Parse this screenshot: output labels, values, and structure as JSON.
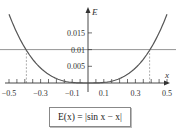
{
  "chart_data": {
    "type": "line",
    "title": "",
    "xlabel": "x",
    "ylabel": "E",
    "xlim": [
      -0.5,
      0.5
    ],
    "ylim": [
      0,
      0.02
    ],
    "x_tick_labels": [
      "-0.5",
      "-0.3",
      "-0.1",
      "0.1",
      "0.3",
      "0.5"
    ],
    "y_tick_labels": [
      "0.005",
      "0.01",
      "0.015"
    ],
    "grid": false,
    "series": [
      {
        "name": "E(x) = |sin x - x|",
        "x": [
          -0.5,
          -0.45,
          -0.4,
          -0.35,
          -0.3,
          -0.25,
          -0.2,
          -0.15,
          -0.1,
          -0.05,
          0,
          0.05,
          0.1,
          0.15,
          0.2,
          0.25,
          0.3,
          0.35,
          0.4,
          0.45,
          0.5
        ],
        "values": [
          0.0206,
          0.0151,
          0.0106,
          0.0071,
          0.0045,
          0.0026,
          0.0013,
          0.0006,
          0.0002,
          2e-05,
          0,
          2e-05,
          0.0002,
          0.0006,
          0.0013,
          0.0026,
          0.0045,
          0.0071,
          0.0106,
          0.0151,
          0.0206
        ]
      }
    ],
    "annotations": [
      {
        "type": "hline",
        "y": 0.01,
        "style": "solid"
      },
      {
        "type": "vline",
        "x": -0.39,
        "style": "dashed",
        "from_y": 0,
        "to_y": 0.01
      },
      {
        "type": "vline",
        "x": 0.39,
        "style": "dashed",
        "from_y": 0,
        "to_y": 0.01
      }
    ],
    "legend": {
      "label": "E(x) = |sin x − x|",
      "position": "bottom-center"
    }
  },
  "axes": {
    "x_label": "x",
    "y_label": "E"
  },
  "formula": {
    "text": "E(x) = |sin x − x|"
  },
  "colors": {
    "curve": "#555555",
    "axis": "#333333",
    "hline": "#777777",
    "dashed": "#999999"
  }
}
